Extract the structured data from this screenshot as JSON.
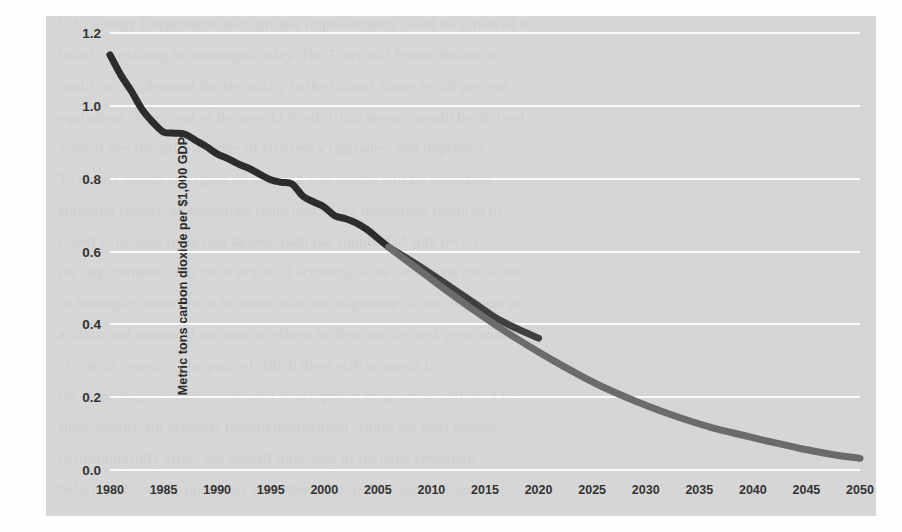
{
  "page": {
    "ghost_lines": [
      {
        "top": 8,
        "text": "U.S. Energy Department, such greater improvements could be achieved if"
      },
      {
        "top": 39,
        "text": "based on existing technologies today. The Electrical Power Research"
      },
      {
        "top": 70,
        "text": "could cut the demand for electricity in the United States by 30 percent"
      },
      {
        "top": 101,
        "text": "equivalent 50 percent of the new U.S. electrical energy would be derived"
      },
      {
        "top": 132,
        "text": "a smart electric grid, a range of efficiency upgrades, and improved"
      },
      {
        "top": 163,
        "text": "To clarify points emerging on the road you should still be expecting"
      },
      {
        "top": 194,
        "text": "emission targets, an emissions reduction of the magnitude required to"
      },
      {
        "top": 225,
        "text": "posed emissions reduction targets, national supply and sink levels"
      },
      {
        "top": 256,
        "text": "the requirements. The most practical economy-wide emissions measures"
      },
      {
        "top": 287,
        "text": "technologies expected to be more than the magnitude of the challenge re-"
      },
      {
        "top": 318,
        "text": "a sharp and sustained increase in efforts to develop the next generation"
      },
      {
        "top": 349,
        "text": "of energy sources. The pace of which these will progress in"
      },
      {
        "top": 380,
        "text": "the technologies of an accelerated development program would need to"
      },
      {
        "top": 411,
        "text": "show significant progress toward deployment within the next decade"
      },
      {
        "top": 442,
        "text": "to meaningfully affect the overall trajectory of national emissions"
      },
      {
        "top": 473,
        "text": "before mid-century under any plausible set of policy assumptions"
      }
    ]
  },
  "chart_data": {
    "type": "line",
    "title": "",
    "subtitle": "",
    "xlabel": "",
    "ylabel": "Metric tons carbon dioxide per $1,000 GDP",
    "xlim": [
      1980,
      2050
    ],
    "ylim": [
      0.0,
      1.2
    ],
    "grid": true,
    "legend_position": "none",
    "x_ticks": [
      1980,
      1985,
      1990,
      1995,
      2000,
      2005,
      2010,
      2015,
      2020,
      2025,
      2030,
      2035,
      2040,
      2045,
      2050
    ],
    "x_tick_labels": [
      "1980",
      "1985",
      "1990",
      "1995",
      "2000",
      "2005",
      "2010",
      "2015",
      "2020",
      "2025",
      "2030",
      "2035",
      "2040",
      "2045",
      "2050"
    ],
    "y_ticks": [
      0.0,
      0.2,
      0.4,
      0.6,
      0.8,
      1.0,
      1.2
    ],
    "y_tick_labels": [
      "0.0",
      "0.2",
      "0.4",
      "0.6",
      "0.8",
      "1.0",
      "1.2"
    ],
    "colors": {
      "historical": "#2c2c2c",
      "projection_near": "#3f3f3f",
      "projection_long": "#6b6b6b",
      "panel_background": "#cdcdcd",
      "gridline": "#fafafa",
      "tick_text": "#333333"
    },
    "series": [
      {
        "name": "historical",
        "label": "Historical carbon intensity",
        "color": "#2c2c2c",
        "width": 7,
        "x": [
          1980,
          1981,
          1982,
          1983,
          1984,
          1985,
          1986,
          1987,
          1988,
          1989,
          1990,
          1991,
          1992,
          1993,
          1994,
          1995,
          1996,
          1997,
          1998,
          1999,
          2000,
          2001,
          2002,
          2003,
          2004,
          2005,
          2006
        ],
        "values": [
          1.14,
          1.085,
          1.04,
          0.99,
          0.955,
          0.928,
          0.925,
          0.922,
          0.905,
          0.888,
          0.868,
          0.855,
          0.84,
          0.828,
          0.812,
          0.797,
          0.79,
          0.785,
          0.752,
          0.736,
          0.722,
          0.698,
          0.69,
          0.678,
          0.66,
          0.636,
          0.612
        ]
      },
      {
        "name": "projection_near",
        "label": "Near-term projection",
        "color": "#3f3f3f",
        "width": 7,
        "x": [
          2006,
          2008,
          2010,
          2012,
          2014,
          2016,
          2018,
          2020
        ],
        "values": [
          0.612,
          0.576,
          0.538,
          0.498,
          0.458,
          0.418,
          0.388,
          0.362
        ]
      },
      {
        "name": "projection_long",
        "label": "Long-term projection",
        "color": "#6b6b6b",
        "width": 7,
        "x": [
          2006,
          2008,
          2010,
          2012,
          2014,
          2016,
          2018,
          2020,
          2022,
          2024,
          2026,
          2028,
          2030,
          2032,
          2034,
          2036,
          2038,
          2040,
          2042,
          2044,
          2046,
          2048,
          2050
        ],
        "values": [
          0.612,
          0.568,
          0.524,
          0.48,
          0.438,
          0.398,
          0.36,
          0.324,
          0.29,
          0.258,
          0.228,
          0.202,
          0.178,
          0.156,
          0.136,
          0.118,
          0.103,
          0.089,
          0.075,
          0.062,
          0.05,
          0.04,
          0.032
        ]
      }
    ]
  }
}
